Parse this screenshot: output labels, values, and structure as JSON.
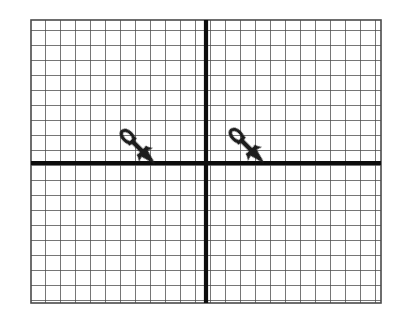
{
  "figure": {
    "background_color": "#ffffff",
    "canvas": {
      "width": 405,
      "height": 321
    }
  },
  "grid": {
    "name": "coordinate-grid",
    "left": 31,
    "top": 20,
    "right": 381,
    "bottom": 303,
    "cell_size": 15,
    "columns": 23,
    "rows": 19,
    "minor_line_color": "#4a4a4a",
    "minor_line_width": 1.4,
    "border_color": "#4a4a4a",
    "show_minor_lines": true,
    "show_labels": false,
    "show_tick_numbers": false
  },
  "axes": {
    "x_axis": {
      "name": "x-axis",
      "label": "",
      "y_position": 163,
      "x_start": 31,
      "x_end": 381,
      "color": "#111111",
      "line_width": 4.2
    },
    "y_axis": {
      "name": "y-axis",
      "label": "",
      "x_position": 206,
      "y_start": 20,
      "y_end": 303,
      "color": "#111111",
      "line_width": 4.2
    },
    "origin": {
      "x": 206,
      "y": 163
    }
  },
  "shapes": [
    {
      "name": "dart-preimage",
      "type": "dart",
      "quadrant": "II",
      "tail_x": 124,
      "tail_y": 133,
      "tip_x": 155,
      "tip_y": 163,
      "angle_deg": 45,
      "color": "#1c1c1c",
      "outline_color": "#1c1c1c"
    },
    {
      "name": "dart-image",
      "type": "dart",
      "quadrant": "I",
      "tail_x": 233,
      "tail_y": 132,
      "tip_x": 264,
      "tip_y": 163,
      "angle_deg": 45,
      "color": "#1c1c1c",
      "outline_color": "#1c1c1c"
    }
  ],
  "chart_data": {
    "type": "scatter",
    "title": "",
    "xlabel": "",
    "ylabel": "",
    "xlim": [
      -11.67,
      11.67
    ],
    "ylim": [
      -9.33,
      9.53
    ],
    "grid": true,
    "legend": false,
    "grid_spacing": 1,
    "categories": [
      "dart-preimage",
      "dart-image"
    ],
    "series": [
      {
        "name": "dart tip points (grid units)",
        "points": [
          {
            "label": "preimage-tip",
            "x": -3.4,
            "y": 0
          },
          {
            "label": "image-tip",
            "x": 3.87,
            "y": 0
          }
        ]
      },
      {
        "name": "dart tail points (grid units)",
        "points": [
          {
            "label": "preimage-tail",
            "x": -5.47,
            "y": 2
          },
          {
            "label": "image-tail",
            "x": 1.8,
            "y": 2.07
          }
        ]
      }
    ],
    "annotations": [
      "Two congruent dart figures shown; the right dart is a horizontal translation of the left dart.",
      "Translation vector approximately 7.3 grid units to the right, 0 units vertically."
    ]
  }
}
